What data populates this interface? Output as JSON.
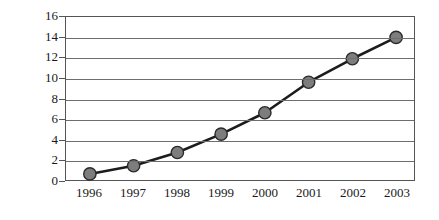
{
  "chart_data": {
    "type": "line",
    "title": "",
    "xlabel": "",
    "ylabel": "Millions of users",
    "categories": [
      "1996",
      "1997",
      "1998",
      "1999",
      "2000",
      "2001",
      "2002",
      "2003"
    ],
    "values": [
      0.6,
      1.4,
      2.7,
      4.5,
      6.6,
      9.6,
      11.9,
      14.0
    ],
    "series": [
      {
        "name": "Millions of users",
        "values": [
          0.6,
          1.4,
          2.7,
          4.5,
          6.6,
          9.6,
          11.9,
          14.0
        ]
      }
    ],
    "ylim": [
      0,
      16
    ],
    "y_ticks": [
      0,
      2,
      4,
      6,
      8,
      10,
      12,
      14,
      16
    ],
    "y_tick_labels": [
      "0",
      "2",
      "4",
      "6",
      "8",
      "10",
      "12",
      "14",
      "16"
    ],
    "x_tick_labels": [
      "1996",
      "1997",
      "1998",
      "1999",
      "2000",
      "2001",
      "2002",
      "2003"
    ],
    "grid": true,
    "grid_axis": "y",
    "legend": false,
    "legend_position": "none",
    "marker": "circle",
    "marker_color": "#7d7d7d",
    "marker_edge_color": "#2a2a2a",
    "line_color": "#1c1c1c",
    "border_color": "#555555",
    "gridline_color": "#6e6e6e",
    "background_color": "#ffffff"
  }
}
